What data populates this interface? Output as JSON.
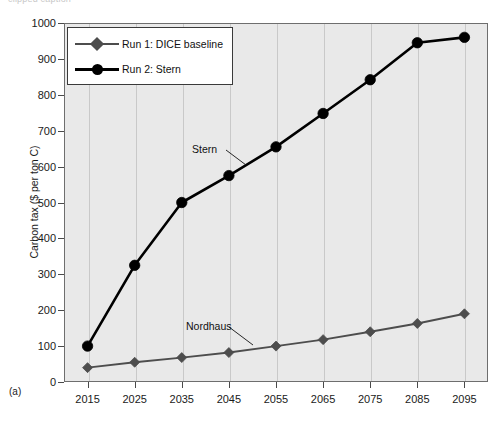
{
  "figure": {
    "panel_label": "(a)",
    "top_caption": "clipped caption",
    "background": "#ffffff",
    "plot_background": "#e9e9e9",
    "frame_color": "#6e6e6e",
    "grid_color": "#c9c9c9"
  },
  "legend": {
    "position": "top-left-inside",
    "entries": [
      {
        "label": "Run 1: DICE baseline",
        "marker": "diamond",
        "color": "#4d4d4d"
      },
      {
        "label": "Run 2: Stern",
        "marker": "circle",
        "color": "#000000"
      }
    ]
  },
  "annotations": [
    {
      "name": "stern",
      "text": "Stern"
    },
    {
      "name": "nordhaus",
      "text": "Nordhaus"
    }
  ],
  "chart_data": {
    "type": "line",
    "title": "",
    "xlabel": "",
    "ylabel": "Carbon tax ($ per ton C)",
    "x": [
      2015,
      2025,
      2035,
      2045,
      2055,
      2065,
      2075,
      2085,
      2095
    ],
    "categories": [
      "2015",
      "2025",
      "2035",
      "2045",
      "2055",
      "2065",
      "2075",
      "2085",
      "2095"
    ],
    "xlim": [
      2010,
      2100
    ],
    "ylim": [
      0,
      1000
    ],
    "ytick_values": [
      0,
      100,
      200,
      300,
      400,
      500,
      600,
      700,
      800,
      900,
      1000
    ],
    "ytick_labels": [
      "0",
      "100",
      "200",
      "300",
      "400",
      "500",
      "600",
      "700",
      "800",
      "900",
      "1000"
    ],
    "grid": "vertical-only",
    "legend_position": "upper-left",
    "series": [
      {
        "name": "Run 1: DICE baseline",
        "short_name": "Nordhaus",
        "marker": "diamond",
        "color": "#4d4d4d",
        "values": [
          40,
          55,
          68,
          82,
          100,
          118,
          140,
          163,
          190
        ]
      },
      {
        "name": "Run 2: Stern",
        "short_name": "Stern",
        "marker": "circle",
        "color": "#000000",
        "values": [
          100,
          325,
          500,
          575,
          655,
          748,
          842,
          945,
          960
        ]
      }
    ]
  }
}
